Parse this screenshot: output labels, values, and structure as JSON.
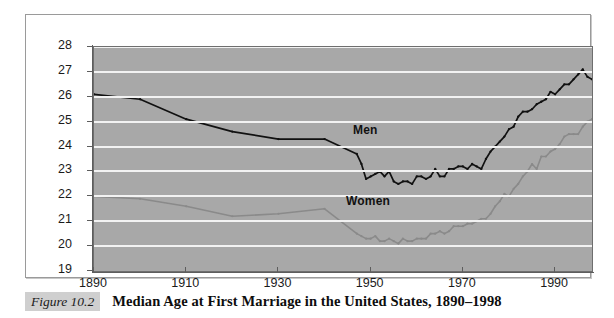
{
  "caption": {
    "figure_number": "Figure 10.2",
    "title": "Median Age at First Marriage in the United States, 1890–1998"
  },
  "colors": {
    "plot_background": "#a8a8a8",
    "gridline": "#f2f2f2",
    "men_series": "#111111",
    "women_series": "#8a8a8a",
    "axis": "#5d5d5d",
    "figure_number_background": "#cfcfcf"
  },
  "chart_data": {
    "type": "line",
    "title": "Median Age at First Marriage in the United States, 1890–1998",
    "xlabel": "",
    "ylabel": "",
    "xlim": [
      1890,
      1998
    ],
    "ylim": [
      19,
      28
    ],
    "grid": true,
    "legend_position": "inline-annotation",
    "x_ticks": [
      "1890",
      "1910",
      "1930",
      "1950",
      "1970",
      "1990"
    ],
    "x_tick_values": [
      1890,
      1910,
      1930,
      1950,
      1970,
      1990
    ],
    "y_ticks": [
      "19",
      "20",
      "21",
      "22",
      "23",
      "24",
      "25",
      "26",
      "27",
      "28"
    ],
    "y_tick_values": [
      19,
      20,
      21,
      22,
      23,
      24,
      25,
      26,
      27,
      28
    ],
    "annotations": [
      {
        "text": "Men",
        "x": 1946,
        "y": 24.6
      },
      {
        "text": "Women",
        "x": 1944,
        "y": 21.75
      }
    ],
    "series": [
      {
        "name": "Men",
        "color": "#111111",
        "x": [
          1890,
          1900,
          1910,
          1920,
          1930,
          1940,
          1947,
          1948,
          1949,
          1950,
          1951,
          1952,
          1953,
          1954,
          1955,
          1956,
          1957,
          1958,
          1959,
          1960,
          1961,
          1962,
          1963,
          1964,
          1965,
          1966,
          1967,
          1968,
          1969,
          1970,
          1971,
          1972,
          1973,
          1974,
          1975,
          1976,
          1977,
          1978,
          1979,
          1980,
          1981,
          1982,
          1983,
          1984,
          1985,
          1986,
          1987,
          1988,
          1989,
          1990,
          1991,
          1992,
          1993,
          1994,
          1995,
          1996,
          1997,
          1998
        ],
        "values": [
          26.1,
          25.9,
          25.1,
          24.6,
          24.3,
          24.3,
          23.7,
          23.3,
          22.7,
          22.8,
          22.9,
          23.0,
          22.8,
          23.0,
          22.6,
          22.5,
          22.6,
          22.6,
          22.5,
          22.8,
          22.8,
          22.7,
          22.8,
          23.1,
          22.8,
          22.8,
          23.1,
          23.1,
          23.2,
          23.2,
          23.1,
          23.3,
          23.2,
          23.1,
          23.5,
          23.8,
          24.0,
          24.2,
          24.4,
          24.7,
          24.8,
          25.2,
          25.4,
          25.4,
          25.5,
          25.7,
          25.8,
          25.9,
          26.2,
          26.1,
          26.3,
          26.5,
          26.5,
          26.7,
          26.9,
          27.1,
          26.8,
          26.7
        ]
      },
      {
        "name": "Women",
        "color": "#8a8a8a",
        "x": [
          1890,
          1900,
          1910,
          1920,
          1930,
          1940,
          1947,
          1948,
          1949,
          1950,
          1951,
          1952,
          1953,
          1954,
          1955,
          1956,
          1957,
          1958,
          1959,
          1960,
          1961,
          1962,
          1963,
          1964,
          1965,
          1966,
          1967,
          1968,
          1969,
          1970,
          1971,
          1972,
          1973,
          1974,
          1975,
          1976,
          1977,
          1978,
          1979,
          1980,
          1981,
          1982,
          1983,
          1984,
          1985,
          1986,
          1987,
          1988,
          1989,
          1990,
          1991,
          1992,
          1993,
          1994,
          1995,
          1996,
          1997,
          1998
        ],
        "values": [
          22.0,
          21.9,
          21.6,
          21.2,
          21.3,
          21.5,
          20.5,
          20.4,
          20.3,
          20.3,
          20.4,
          20.2,
          20.2,
          20.3,
          20.2,
          20.1,
          20.3,
          20.2,
          20.2,
          20.3,
          20.3,
          20.3,
          20.5,
          20.5,
          20.6,
          20.5,
          20.6,
          20.8,
          20.8,
          20.8,
          20.9,
          20.9,
          21.0,
          21.1,
          21.1,
          21.3,
          21.6,
          21.8,
          22.1,
          22.0,
          22.3,
          22.5,
          22.8,
          23.0,
          23.3,
          23.1,
          23.6,
          23.6,
          23.8,
          23.9,
          24.1,
          24.4,
          24.5,
          24.5,
          24.5,
          24.8,
          25.0,
          25.1
        ]
      }
    ]
  }
}
